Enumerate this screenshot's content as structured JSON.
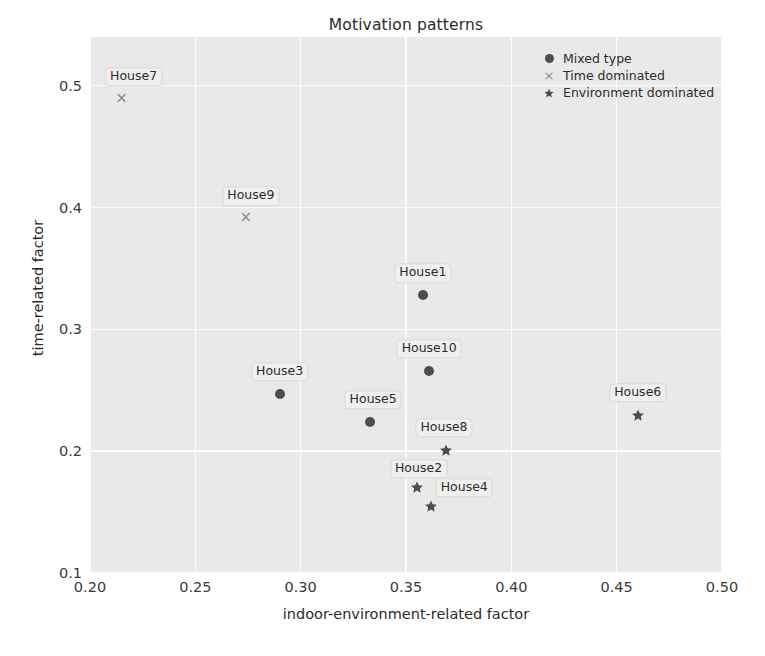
{
  "chart_data": {
    "type": "scatter",
    "title": "Motivation patterns",
    "xlabel": "indoor-environment-related factor",
    "ylabel": "time-related factor",
    "xlim": [
      0.2,
      0.5
    ],
    "ylim": [
      0.1,
      0.54
    ],
    "xticks": [
      "0.20",
      "0.25",
      "0.30",
      "0.35",
      "0.40",
      "0.45",
      "0.50"
    ],
    "xtick_values": [
      0.2,
      0.25,
      0.3,
      0.35,
      0.4,
      0.45,
      0.5
    ],
    "yticks": [
      "0.1",
      "0.2",
      "0.3",
      "0.4",
      "0.5"
    ],
    "ytick_values": [
      0.1,
      0.2,
      0.3,
      0.4,
      0.5
    ],
    "grid": true,
    "grid_color": "#fbfbfb",
    "plot_background": "#e9e9e9",
    "legend_position": "top-right",
    "marker_color": "#4d4d4d",
    "cross_color": "#8a8a8a",
    "series": [
      {
        "name": "Mixed type",
        "marker": "circle",
        "points": [
          {
            "label": "House1",
            "x": 0.358,
            "y": 0.328,
            "label_dx": 0,
            "label_dy": -22
          },
          {
            "label": "House10",
            "x": 0.361,
            "y": 0.266,
            "label_dx": 0,
            "label_dy": -22
          },
          {
            "label": "House3",
            "x": 0.29,
            "y": 0.247,
            "label_dx": 0,
            "label_dy": -22
          },
          {
            "label": "House5",
            "x": 0.333,
            "y": 0.224,
            "label_dx": 3,
            "label_dy": -22
          }
        ]
      },
      {
        "name": "Time dominated",
        "marker": "cross",
        "points": [
          {
            "label": "House7",
            "x": 0.215,
            "y": 0.49,
            "label_dx": 12,
            "label_dy": -21
          },
          {
            "label": "House9",
            "x": 0.274,
            "y": 0.392,
            "label_dx": 5,
            "label_dy": -21
          }
        ]
      },
      {
        "name": "Environment dominated",
        "marker": "star",
        "points": [
          {
            "label": "House8",
            "x": 0.369,
            "y": 0.201,
            "label_dx": -2,
            "label_dy": -22
          },
          {
            "label": "House2",
            "x": 0.355,
            "y": 0.171,
            "label_dx": 2,
            "label_dy": -18
          },
          {
            "label": "House4",
            "x": 0.362,
            "y": 0.155,
            "label_dx": 33,
            "label_dy": -18
          },
          {
            "label": "House6",
            "x": 0.46,
            "y": 0.23,
            "label_dx": 0,
            "label_dy": -22
          }
        ]
      }
    ]
  }
}
